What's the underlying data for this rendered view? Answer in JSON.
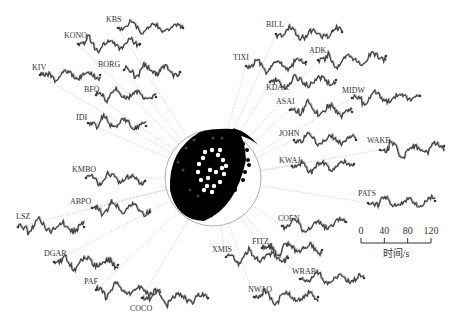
{
  "figure": {
    "center": [
      213,
      178
    ],
    "outer_radius": 48,
    "stations": [
      {
        "name": "KBS",
        "lx": 106,
        "ly": 22,
        "wx": 118,
        "wy": 28,
        "ex": 183,
        "ey": 28,
        "amp": 8,
        "seed": 1
      },
      {
        "name": "KONO",
        "lx": 64,
        "ly": 38,
        "wx": 78,
        "wy": 44,
        "ex": 140,
        "ey": 44,
        "amp": 9,
        "seed": 2
      },
      {
        "name": "KIV",
        "lx": 32,
        "ly": 70,
        "wx": 40,
        "wy": 75,
        "ex": 100,
        "ey": 75,
        "amp": 8,
        "seed": 3
      },
      {
        "name": "BORG",
        "lx": 98,
        "ly": 67,
        "wx": 124,
        "wy": 70,
        "ex": 180,
        "ey": 72,
        "amp": 9,
        "seed": 4
      },
      {
        "name": "BFO",
        "lx": 84,
        "ly": 92,
        "wx": 96,
        "wy": 95,
        "ex": 156,
        "ey": 97,
        "amp": 8,
        "seed": 5
      },
      {
        "name": "IDI",
        "lx": 76,
        "ly": 120,
        "wx": 88,
        "wy": 123,
        "ex": 146,
        "ey": 126,
        "amp": 8,
        "seed": 6
      },
      {
        "name": "BILL",
        "lx": 266,
        "ly": 27,
        "wx": 276,
        "wy": 34,
        "ex": 342,
        "ey": 32,
        "amp": 9,
        "seed": 7
      },
      {
        "name": "TIXI",
        "lx": 233,
        "ly": 60,
        "wx": 246,
        "wy": 66,
        "ex": 306,
        "ey": 62,
        "amp": 9,
        "seed": 8
      },
      {
        "name": "ADK",
        "lx": 309,
        "ly": 53,
        "wx": 318,
        "wy": 60,
        "ex": 386,
        "ey": 56,
        "amp": 9,
        "seed": 9
      },
      {
        "name": "KDAK",
        "lx": 266,
        "ly": 90,
        "wx": 270,
        "wy": 82,
        "ex": 336,
        "ey": 80,
        "amp": 8,
        "seed": 10
      },
      {
        "name": "MIDW",
        "lx": 342,
        "ly": 93,
        "wx": 352,
        "wy": 98,
        "ex": 420,
        "ey": 96,
        "amp": 8,
        "seed": 11
      },
      {
        "name": "ASAI",
        "lx": 276,
        "ly": 104,
        "wx": 290,
        "wy": 110,
        "ex": 352,
        "ey": 112,
        "amp": 10,
        "seed": 12
      },
      {
        "name": "JOHN",
        "lx": 279,
        "ly": 136,
        "wx": 294,
        "wy": 140,
        "ex": 356,
        "ey": 140,
        "amp": 8,
        "seed": 13
      },
      {
        "name": "WAKE",
        "lx": 367,
        "ly": 143,
        "wx": 380,
        "wy": 150,
        "ex": 444,
        "ey": 146,
        "amp": 10,
        "seed": 14
      },
      {
        "name": "KWAJ",
        "lx": 279,
        "ly": 163,
        "wx": 292,
        "wy": 166,
        "ex": 354,
        "ey": 164,
        "amp": 8,
        "seed": 15
      },
      {
        "name": "KMBO",
        "lx": 72,
        "ly": 172,
        "wx": 86,
        "wy": 178,
        "ex": 145,
        "ey": 181,
        "amp": 9,
        "seed": 16
      },
      {
        "name": "ABPO",
        "lx": 70,
        "ly": 204,
        "wx": 92,
        "wy": 208,
        "ex": 150,
        "ey": 212,
        "amp": 9,
        "seed": 17
      },
      {
        "name": "LSZ",
        "lx": 16,
        "ly": 219,
        "wx": 18,
        "wy": 227,
        "ex": 84,
        "ey": 227,
        "amp": 10,
        "seed": 18
      },
      {
        "name": "PATS",
        "lx": 358,
        "ly": 196,
        "wx": 368,
        "wy": 203,
        "ex": 435,
        "ey": 201,
        "amp": 8,
        "seed": 19
      },
      {
        "name": "COEN",
        "lx": 278,
        "ly": 221,
        "wx": 282,
        "wy": 226,
        "ex": 346,
        "ey": 222,
        "amp": 8,
        "seed": 20
      },
      {
        "name": "DGAR",
        "lx": 44,
        "ly": 256,
        "wx": 54,
        "wy": 262,
        "ex": 118,
        "ey": 265,
        "amp": 9,
        "seed": 21
      },
      {
        "name": "FITZ",
        "lx": 252,
        "ly": 244,
        "wx": 262,
        "wy": 248,
        "ex": 322,
        "ey": 250,
        "amp": 9,
        "seed": 22
      },
      {
        "name": "XMIS",
        "lx": 212,
        "ly": 252,
        "wx": 226,
        "wy": 257,
        "ex": 288,
        "ey": 258,
        "amp": 9,
        "seed": 23
      },
      {
        "name": "PAF",
        "lx": 84,
        "ly": 284,
        "wx": 96,
        "wy": 290,
        "ex": 160,
        "ey": 292,
        "amp": 9,
        "seed": 24
      },
      {
        "name": "WRAB",
        "lx": 292,
        "ly": 274,
        "wx": 300,
        "wy": 279,
        "ex": 364,
        "ey": 278,
        "amp": 8,
        "seed": 25
      },
      {
        "name": "COCO",
        "lx": 130,
        "ly": 311,
        "wx": 142,
        "wy": 298,
        "ex": 208,
        "ey": 298,
        "amp": 9,
        "seed": 26
      },
      {
        "name": "NWAO",
        "lx": 248,
        "ly": 292,
        "wx": 254,
        "wy": 297,
        "ex": 318,
        "ey": 297,
        "amp": 8,
        "seed": 27
      }
    ],
    "scale_bar": {
      "ticks": [
        "0",
        "40",
        "80",
        "120"
      ],
      "label": "时间/s",
      "x0": 361,
      "x1": 431,
      "y": 243
    }
  }
}
